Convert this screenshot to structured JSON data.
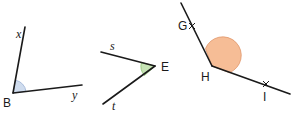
{
  "figures": [
    {
      "name": "angle-xBy",
      "vertex_label": "B",
      "ray_labels": [
        "x",
        "y"
      ],
      "arc_color": "#cfdcee",
      "arc_stroke": "#9db3d6"
    },
    {
      "name": "angle-sEt",
      "vertex_label": "E",
      "ray_labels": [
        "s",
        "t"
      ],
      "arc_color": "#c6e3b5",
      "arc_stroke": "#8cc070"
    },
    {
      "name": "angle-GHI",
      "vertex_label": "H",
      "point_labels": [
        "G",
        "I"
      ],
      "arc_color": "#f6bd96",
      "arc_stroke": "#e0956a"
    }
  ]
}
